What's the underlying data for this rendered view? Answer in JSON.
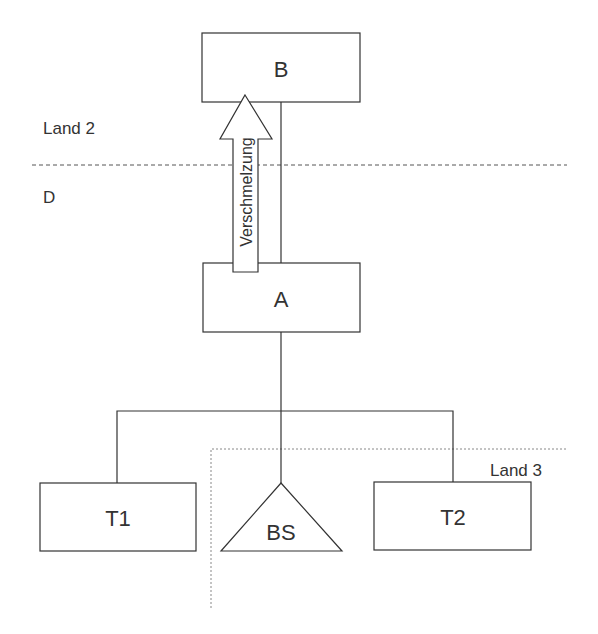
{
  "diagram": {
    "regions": {
      "upper_label": "Land 2",
      "lower_label": "D",
      "corner_label": "Land 3"
    },
    "nodes": {
      "b": {
        "label": "B"
      },
      "a": {
        "label": "A"
      },
      "t1": {
        "label": "T1"
      },
      "t2": {
        "label": "T2"
      },
      "bs": {
        "label": "BS"
      }
    },
    "arrow": {
      "label": "Verschmelzung"
    },
    "colors": {
      "stroke": "#333333",
      "dashed": "#555555",
      "dotted": "#888888",
      "background": "#ffffff"
    }
  }
}
